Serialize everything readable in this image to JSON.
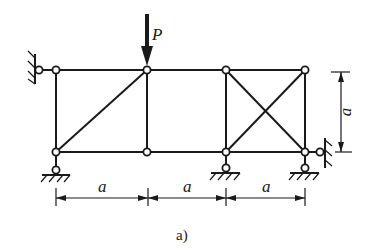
{
  "figure": {
    "caption": "a)",
    "load_label": "P",
    "dimension_labels": {
      "span_1": "a",
      "span_2": "a",
      "span_3": "a",
      "height": "a"
    },
    "colors": {
      "ink": "#1a1a1a",
      "background": "#ffffff"
    }
  },
  "truss": {
    "panels": 3,
    "nodes": [
      {
        "id": "top-0",
        "x": 56,
        "y": 70
      },
      {
        "id": "top-1",
        "x": 147,
        "y": 70
      },
      {
        "id": "top-2",
        "x": 226,
        "y": 70
      },
      {
        "id": "top-3",
        "x": 305,
        "y": 70
      },
      {
        "id": "bot-0",
        "x": 56,
        "y": 152
      },
      {
        "id": "bot-1",
        "x": 147,
        "y": 152
      },
      {
        "id": "bot-2",
        "x": 226,
        "y": 152
      },
      {
        "id": "bot-3",
        "x": 305,
        "y": 152
      }
    ],
    "supports": [
      {
        "type": "horizontal-link",
        "at": "top-0",
        "side": "left"
      },
      {
        "type": "vertical-link",
        "at": "bot-0"
      },
      {
        "type": "vertical-link",
        "at": "bot-2"
      },
      {
        "type": "vertical-link",
        "at": "bot-3"
      },
      {
        "type": "horizontal-link",
        "at": "bot-3",
        "side": "right"
      }
    ],
    "load": {
      "at": "top-1",
      "direction": "down",
      "label": "P"
    }
  }
}
